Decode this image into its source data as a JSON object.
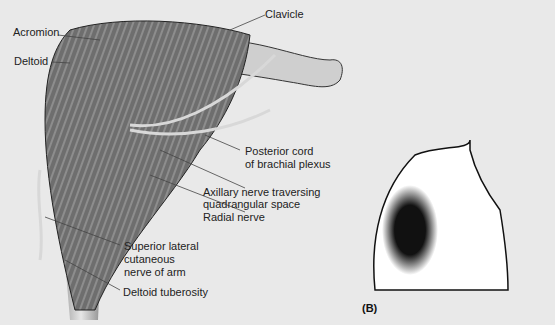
{
  "figure": {
    "panel_a": {
      "labels": {
        "acromion": "Acromion",
        "deltoid": "Deltoid",
        "clavicle": "Clavicle",
        "posterior_cord_1": "Posterior cord",
        "posterior_cord_2": "of brachial plexus",
        "axillary_1": "Axillary nerve traversing",
        "axillary_2": "quadrangular space",
        "radial": "Radial nerve",
        "slcn_1": "Superior lateral",
        "slcn_2": "cutaneous",
        "slcn_3": "nerve of arm",
        "tuberosity": "Deltoid tuberosity"
      }
    },
    "panel_b": {
      "tag": "(B)"
    },
    "colors": {
      "background": "#e9e9e9",
      "muscle": "#6b6b6b",
      "bone": "#c9c9c9",
      "outline": "#111111",
      "body_fill": "#ffffff"
    }
  }
}
